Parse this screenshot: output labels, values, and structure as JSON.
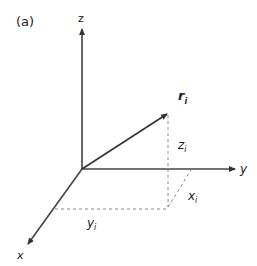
{
  "panel_label": "(a)",
  "axes": {
    "z": "z",
    "y": "y",
    "x": "x"
  },
  "vector": {
    "name": "r",
    "subscript": "i"
  },
  "components": {
    "z": {
      "name": "z",
      "subscript": "i"
    },
    "x": {
      "name": "x",
      "subscript": "i"
    },
    "y": {
      "name": "y",
      "subscript": "i"
    }
  },
  "colors": {
    "axis": "#333333",
    "dash": "#777777"
  }
}
